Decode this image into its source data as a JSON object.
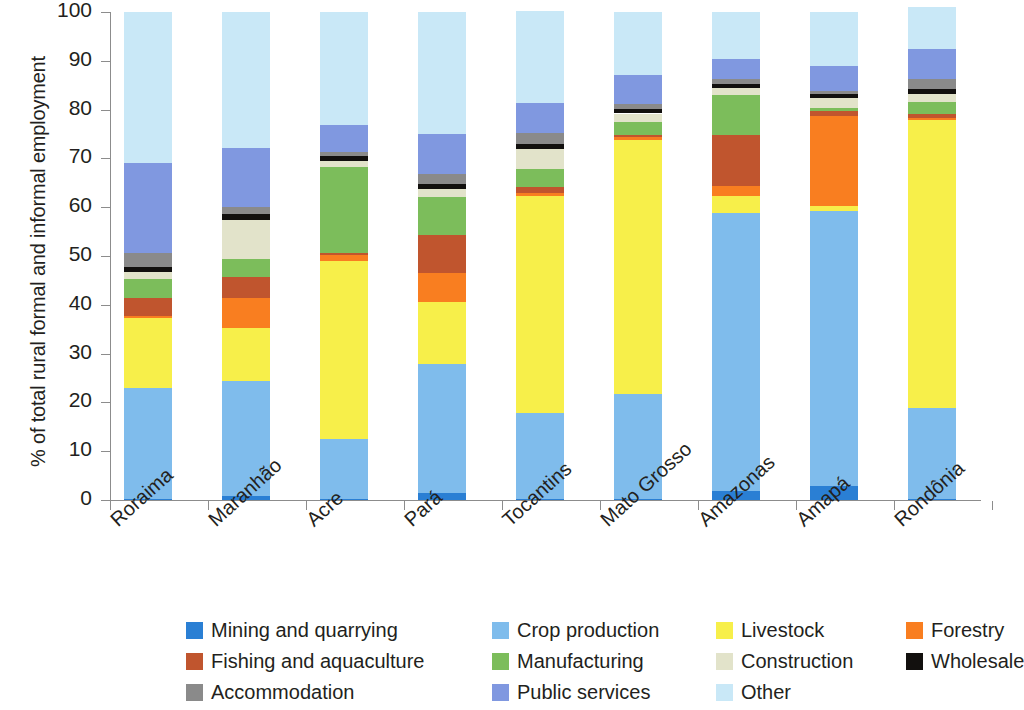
{
  "chart_data": {
    "type": "bar",
    "subtype": "stacked-bar-100",
    "title": "",
    "xlabel": "",
    "ylabel": "% of total rural formal and informal employment",
    "ylim": [
      0,
      100
    ],
    "yticks": [
      0,
      10,
      20,
      30,
      40,
      50,
      60,
      70,
      80,
      90,
      100
    ],
    "ytick_labels": [
      "0",
      "10",
      "20",
      "30",
      "40",
      "50",
      "60",
      "70",
      "80",
      "90",
      "100"
    ],
    "grid": false,
    "legend_position": "bottom",
    "categories": [
      "Roraima",
      "Maranhão",
      "Acre",
      "Pará",
      "Tocantins",
      "Mato Grosso",
      "Amazonas",
      "Amapá",
      "Rondônia"
    ],
    "series": [
      {
        "name": "Mining and quarrying",
        "color": "#2a7fd4",
        "values": [
          0.2,
          0.8,
          0.3,
          1.4,
          0.3,
          0.3,
          1.9,
          2.8,
          0.3
        ]
      },
      {
        "name": "Crop production",
        "color": "#7fbcec",
        "values": [
          22.8,
          23.6,
          12.3,
          26.4,
          17.6,
          21.5,
          57.0,
          56.5,
          18.5
        ]
      },
      {
        "name": "Livestock",
        "color": "#f7ef4a",
        "values": [
          14.2,
          10.8,
          36.4,
          12.8,
          44.4,
          52.0,
          3.4,
          1.0,
          59.0
        ]
      },
      {
        "name": "Forestry",
        "color": "#f97e20",
        "values": [
          0.6,
          6.2,
          1.3,
          6.0,
          0.7,
          0.6,
          2.0,
          18.4,
          0.5
        ]
      },
      {
        "name": "Fishing and aquaculture",
        "color": "#c0552e",
        "values": [
          3.5,
          4.2,
          0.3,
          7.8,
          1.2,
          0.4,
          10.4,
          1.0,
          0.8
        ]
      },
      {
        "name": "Manufacturing",
        "color": "#7cbd5b",
        "values": [
          4.0,
          3.8,
          17.7,
          7.7,
          3.7,
          2.6,
          8.3,
          0.7,
          2.5
        ]
      },
      {
        "name": "Construction",
        "color": "#e2e3ca",
        "values": [
          1.4,
          8.0,
          1.2,
          1.6,
          4.0,
          1.8,
          1.5,
          2.0,
          1.5
        ]
      },
      {
        "name": "Wholesale",
        "color": "#12100e",
        "values": [
          1.1,
          1.2,
          0.9,
          1.1,
          1.1,
          1.0,
          0.7,
          0.8,
          1.1
        ]
      },
      {
        "name": "Accommodation",
        "color": "#8a8a8a",
        "values": [
          2.8,
          1.5,
          1.0,
          2.1,
          2.3,
          1.0,
          1.1,
          0.7,
          2.0
        ]
      },
      {
        "name": "Public services",
        "color": "#8098e0",
        "values": [
          18.4,
          12.0,
          5.5,
          8.0,
          6.0,
          5.8,
          4.1,
          5.1,
          6.3
        ]
      },
      {
        "name": "Other",
        "color": "#c9e8f7",
        "values": [
          31.0,
          28.0,
          23.0,
          25.0,
          19.0,
          13.0,
          9.6,
          11.0,
          8.5
        ]
      }
    ]
  },
  "legend": {
    "items": [
      {
        "label": "Mining and quarrying",
        "color": "#2a7fd4",
        "col": 0,
        "row": 0
      },
      {
        "label": "Crop production",
        "color": "#7fbcec",
        "col": 1,
        "row": 0
      },
      {
        "label": "Livestock",
        "color": "#f7ef4a",
        "col": 2,
        "row": 0
      },
      {
        "label": "Forestry",
        "color": "#f97e20",
        "col": 3,
        "row": 0
      },
      {
        "label": "Fishing and aquaculture",
        "color": "#c0552e",
        "col": 0,
        "row": 1
      },
      {
        "label": "Manufacturing",
        "color": "#7cbd5b",
        "col": 1,
        "row": 1
      },
      {
        "label": "Construction",
        "color": "#e2e3ca",
        "col": 2,
        "row": 1
      },
      {
        "label": "Wholesale",
        "color": "#12100e",
        "col": 3,
        "row": 1
      },
      {
        "label": "Accommodation",
        "color": "#8a8a8a",
        "col": 0,
        "row": 2
      },
      {
        "label": "Public services",
        "color": "#8098e0",
        "col": 1,
        "row": 2
      },
      {
        "label": "Other",
        "color": "#c9e8f7",
        "col": 2,
        "row": 2
      }
    ]
  },
  "geometry": {
    "plot_left": 110,
    "plot_top": 12,
    "plot_height": 488,
    "bar_width": 48,
    "bar_slot": 98,
    "first_bar_center": 148,
    "legend_col_x": [
      0,
      306,
      530,
      720
    ]
  }
}
